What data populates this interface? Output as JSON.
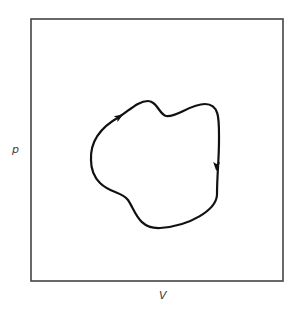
{
  "diagram": {
    "type": "pV cycle diagram",
    "frame": {
      "x": 31,
      "y": 19,
      "width": 252,
      "height": 262,
      "stroke": "#444444"
    },
    "axes": {
      "y_label": "p",
      "x_label": "V"
    },
    "cycle": {
      "direction": "clockwise",
      "stroke": "#111111",
      "path": "M 91 160 C 90 140, 103 126, 119 117 C 130 110, 138 101, 148 101 C 157 101, 159 114, 166 116 C 176 118, 190 104, 205 104 C 220 104, 219 120, 219 140 C 219 160, 217 175, 217 195 C 216 210, 190 226, 160 228 C 138 229, 135 210, 128 200 C 122 192, 110 193, 100 183 C 93 176, 91 168, 91 160 Z",
      "arrows": [
        {
          "name": "upper-left-arrow",
          "x": 119,
          "y": 117,
          "direction": "up-right"
        },
        {
          "name": "right-side-arrow",
          "x": 216,
          "y": 166,
          "direction": "down"
        }
      ]
    }
  }
}
